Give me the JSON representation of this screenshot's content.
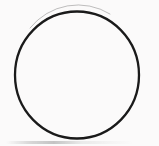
{
  "figure": {
    "shape_name": "circle",
    "filled": false,
    "canvas": {
      "width": 159,
      "height": 146,
      "background_color": "#fbfafa"
    },
    "stroke": {
      "color": "#1a1a1a",
      "width_px": 2.3,
      "style": "solid",
      "linecap": "round"
    },
    "geometry": {
      "center_x": 77,
      "center_y": 75,
      "radius_x": 62,
      "radius_y": 63.5,
      "bounds": {
        "left": 15,
        "top": 11.5,
        "right": 139,
        "bottom": 138.5
      }
    },
    "artifacts": {
      "bottom_smudge_label": "scan-edge-smudge",
      "bottom_smudge_color": "#8c8c8c"
    },
    "labels": [],
    "caption": ""
  }
}
